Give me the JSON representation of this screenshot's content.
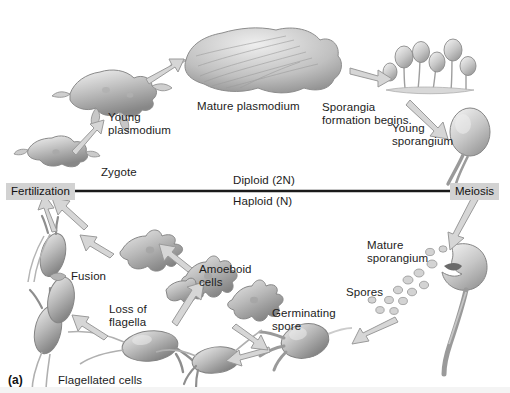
{
  "figure": {
    "panel_label": "(a)",
    "background": "#ffffff",
    "ink": "#1c1c1c",
    "stage_box_bg": "#d2d2d2",
    "organism_fill_light": "#e9e9e9",
    "organism_fill_mid": "#b8b8b8",
    "organism_fill_dark": "#8a8a8a",
    "arrow_stroke": "#9a9a9a",
    "arrow_fill": "#d8d8d8"
  },
  "axis_line": {
    "above_label": "Diploid (2N)",
    "below_label": "Haploid (N)"
  },
  "stages": [
    {
      "id": "fertilization",
      "label": "Fertilization",
      "x": 6,
      "y": 183
    },
    {
      "id": "meiosis",
      "label": "Meiosis",
      "x": 450,
      "y": 183
    }
  ],
  "labels": [
    {
      "id": "zygote",
      "text": "Zygote",
      "x": 101,
      "y": 166
    },
    {
      "id": "young-plasmodium",
      "text": "Young\nplasmodium",
      "x": 108,
      "y": 111
    },
    {
      "id": "mature-plasmodium",
      "text": "Mature plasmodium",
      "x": 197,
      "y": 100
    },
    {
      "id": "sporangia-formation",
      "text": "Sporangia\nformation begins.",
      "x": 322,
      "y": 101
    },
    {
      "id": "young-sporangium",
      "text": "Young\nsporangium",
      "x": 392,
      "y": 122
    },
    {
      "id": "mature-sporangium",
      "text": "Mature\nsporangium",
      "x": 367,
      "y": 239
    },
    {
      "id": "spores",
      "text": "Spores",
      "x": 346,
      "y": 286
    },
    {
      "id": "germinating-spore",
      "text": "Germinating\nspore",
      "x": 272,
      "y": 307
    },
    {
      "id": "amoeboid-cells",
      "text": "Amoeboid\ncells",
      "x": 199,
      "y": 263
    },
    {
      "id": "loss-of-flagella",
      "text": "Loss of\nflagella",
      "x": 109,
      "y": 303
    },
    {
      "id": "fusion",
      "text": "Fusion",
      "x": 71,
      "y": 270
    },
    {
      "id": "flagellated-cells",
      "text": "Flagellated cells",
      "x": 58,
      "y": 374
    }
  ]
}
